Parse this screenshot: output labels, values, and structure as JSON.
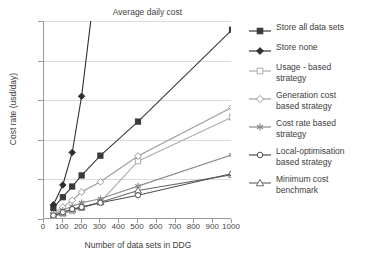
{
  "chart_data": {
    "type": "line",
    "title": "Average daily cost",
    "xlabel": "Number of data sets in DDG",
    "ylabel": "Cost rate (usd/day)",
    "xlim": [
      0,
      1000
    ],
    "ylim": [
      0,
      2500
    ],
    "x_ticks": [
      0,
      100,
      200,
      300,
      400,
      500,
      600,
      700,
      800,
      900,
      1000
    ],
    "y_ticks": [
      0,
      500,
      1000,
      1500,
      2000,
      2500
    ],
    "grid": "horizontal",
    "legend_position": "right",
    "x": [
      50,
      100,
      150,
      200,
      300,
      500,
      1000
    ],
    "series": [
      {
        "name": "Store all data sets",
        "marker": "filled-square",
        "color": "#3a3a3a",
        "values": [
          140,
          275,
          410,
          550,
          800,
          1230,
          2390
        ]
      },
      {
        "name": "Store none",
        "marker": "filled-diamond",
        "color": "#2f2f2f",
        "values": [
          180,
          430,
          840,
          1550,
          3500,
          7800,
          25000
        ]
      },
      {
        "name": "Usage - based\nstrategy",
        "marker": "open-square",
        "color": "#adadad",
        "values": [
          30,
          62,
          100,
          140,
          215,
          730,
          1285
        ]
      },
      {
        "name": "Generation cost\nbased strategy",
        "marker": "open-diamond",
        "color": "#9b9b9b",
        "values": [
          75,
          150,
          235,
          340,
          470,
          795,
          1410
        ]
      },
      {
        "name": "Cost rate based\nstrategy",
        "marker": "asterisk",
        "color": "#8c8c8c",
        "values": [
          60,
          110,
          160,
          205,
          255,
          415,
          810
        ]
      },
      {
        "name": "Local-optimisation\nbased strategy",
        "marker": "open-circle",
        "color": "#4f4f4f",
        "values": [
          45,
          85,
          125,
          150,
          205,
          300,
          575
        ]
      },
      {
        "name": "Minimum cost\nbenchmark",
        "marker": "open-triangle",
        "color": "#6b6b6b",
        "values": [
          40,
          80,
          120,
          148,
          212,
          360,
          560
        ]
      }
    ]
  }
}
